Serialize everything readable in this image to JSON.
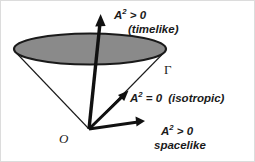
{
  "figure": {
    "name": "light-cone-diagram",
    "background_color": "#ffffff",
    "border_color": "#dcdcdc",
    "stroke_color": "#1a1a1a",
    "cone_fill_color": "#8a8a8a",
    "width": 255,
    "height": 162
  },
  "labels": {
    "timelike_expr": "A",
    "timelike_sup": "2",
    "timelike_rel": " > 0",
    "timelike_kind": "(timelike)",
    "isotropic_expr": "A",
    "isotropic_sup": "2",
    "isotropic_rel": " = 0",
    "isotropic_kind": "(isotropic)",
    "spacelike_expr": "A",
    "spacelike_sup": "2",
    "spacelike_rel": " > 0",
    "spacelike_kind": "spacelike",
    "gamma": "Γ",
    "origin": "O"
  },
  "geometry": {
    "origin_point": [
      88,
      128
    ],
    "ellipse_center": [
      89,
      48
    ],
    "ellipse_rx": 76,
    "ellipse_ry": 15,
    "timelike_arrow_tip": [
      99,
      14
    ],
    "isotropic_arrow_tip": [
      126,
      91
    ],
    "spacelike_arrow_tip": [
      143,
      120
    ]
  }
}
